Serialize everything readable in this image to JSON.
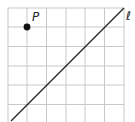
{
  "diagram": {
    "type": "coordinate-grid",
    "grid": {
      "columns": 6,
      "rows": 6,
      "line_color": "#c8c8c8"
    },
    "point": {
      "label": "P",
      "grid_col": 1,
      "grid_row": 1,
      "color": "#111111"
    },
    "line": {
      "label": "ℓ",
      "from": "bottom-left",
      "to": "top-right",
      "color": "#222222"
    }
  }
}
